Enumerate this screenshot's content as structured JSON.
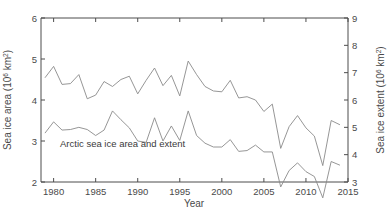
{
  "chart_data": {
    "type": "line",
    "title": "",
    "annotation": "Arctic sea ice area and extent",
    "xlabel": "Year",
    "ylabel": "Sea ice area (10⁶ km²)",
    "ylabel_left_main": "Sea ice area (10",
    "ylabel_left_exp": "6",
    "ylabel_left_tail": " km",
    "ylabel_right_main": "Sea ice extent (10",
    "ylabel_right_exp": "6",
    "ylabel_right_tail": " km",
    "unit_exp": "2",
    "ylabel_right": "Sea ice extent (10⁶ km²)",
    "xlim": [
      1978.5,
      2015
    ],
    "ylim_left": [
      2,
      6
    ],
    "ylim_right": [
      3,
      9
    ],
    "grid": false,
    "legend": "none",
    "xticks": [
      "1980",
      "1985",
      "1990",
      "1995",
      "2000",
      "2005",
      "2010",
      "2015"
    ],
    "xtick_values": [
      1980,
      1985,
      1990,
      1995,
      2000,
      2005,
      2010,
      2015
    ],
    "yticks_left": [
      "2",
      "3",
      "4",
      "5",
      "6"
    ],
    "ytick_values_left": [
      2,
      3,
      4,
      5,
      6
    ],
    "yticks_right": [
      "3",
      "4",
      "5",
      "6",
      "7",
      "8",
      "9"
    ],
    "ytick_values_right": [
      3,
      4,
      5,
      6,
      7,
      8,
      9
    ],
    "x": [
      1979,
      1980,
      1981,
      1982,
      1983,
      1984,
      1985,
      1986,
      1987,
      1988,
      1989,
      1990,
      1991,
      1992,
      1993,
      1994,
      1995,
      1996,
      1997,
      1998,
      1999,
      2000,
      2001,
      2002,
      2003,
      2004,
      2005,
      2006,
      2007,
      2008,
      2009,
      2010,
      2011,
      2012,
      2013,
      2014
    ],
    "series": [
      {
        "name": "Sea ice area",
        "axis": "left",
        "color": "#8a8a8a",
        "values": [
          4.55,
          4.82,
          4.38,
          4.4,
          4.62,
          4.03,
          4.12,
          4.45,
          4.33,
          4.5,
          4.58,
          4.15,
          4.48,
          4.78,
          4.35,
          4.6,
          4.1,
          4.95,
          4.62,
          4.33,
          4.22,
          4.2,
          4.48,
          4.05,
          4.08,
          4.0,
          3.72,
          3.9,
          2.82,
          3.35,
          3.62,
          3.32,
          3.12,
          2.4,
          3.5,
          3.4
        ]
      },
      {
        "name": "Sea ice extent",
        "axis": "right",
        "color": "#8a8a8a",
        "values": [
          4.8,
          5.2,
          4.9,
          4.92,
          5.0,
          4.92,
          4.7,
          4.9,
          5.6,
          5.28,
          4.98,
          4.5,
          4.45,
          5.35,
          4.5,
          5.05,
          4.52,
          5.6,
          4.7,
          4.42,
          4.28,
          4.28,
          4.55,
          4.12,
          4.15,
          4.35,
          4.1,
          4.1,
          2.82,
          3.42,
          3.7,
          3.38,
          3.2,
          2.42,
          3.75,
          3.62
        ]
      }
    ]
  },
  "figure": {
    "background_color": "#ffffff",
    "axis_color": "#4d4d4d",
    "text_color": "#4a4a4a"
  }
}
